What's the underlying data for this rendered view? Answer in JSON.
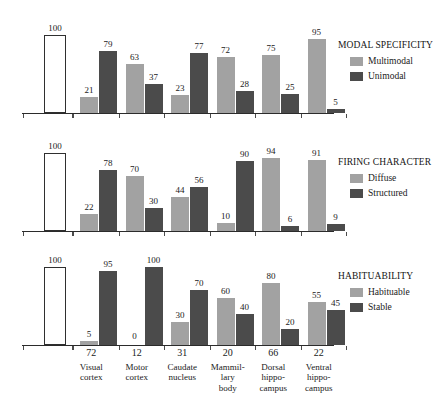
{
  "chart_data": {
    "type": "bar",
    "title": "",
    "xlabel": "",
    "ylabel": "",
    "ylim": [
      0,
      100
    ],
    "grid": false,
    "legend_position": "right",
    "categories": [
      "Visual cortex",
      "Motor cortex",
      "Caudate nucleus",
      "Mammillary body",
      "Dorsal hippocampus",
      "Ventral hippocampus"
    ],
    "category_numbers": [
      72,
      12,
      31,
      20,
      66,
      22
    ],
    "reference_bar_value": 100,
    "panels": [
      {
        "legend_title": "MODAL SPECIFICITY",
        "series": [
          {
            "name": "Multimodal",
            "color": "#a2a2a2",
            "values": [
              21,
              63,
              23,
              72,
              75,
              95
            ]
          },
          {
            "name": "Unimodal",
            "color": "#4b4b4b",
            "values": [
              79,
              37,
              77,
              28,
              25,
              5
            ]
          }
        ]
      },
      {
        "legend_title": "FIRING CHARACTER",
        "series": [
          {
            "name": "Diffuse",
            "color": "#a2a2a2",
            "values": [
              22,
              70,
              44,
              10,
              94,
              91
            ]
          },
          {
            "name": "Structured",
            "color": "#4b4b4b",
            "values": [
              78,
              30,
              56,
              90,
              6,
              9
            ]
          }
        ]
      },
      {
        "legend_title": "HABITUABILITY",
        "series": [
          {
            "name": "Habituable",
            "color": "#a2a2a2",
            "values": [
              5,
              0,
              30,
              60,
              80,
              55
            ]
          },
          {
            "name": "Stable",
            "color": "#4b4b4b",
            "values": [
              95,
              100,
              70,
              40,
              20,
              45
            ]
          }
        ]
      }
    ]
  },
  "category_labels_wrapped": [
    [
      "Visual",
      "cortex"
    ],
    [
      "Motor",
      "cortex"
    ],
    [
      "Caudate",
      "nucleus"
    ],
    [
      "Mammil-",
      "lary",
      "body"
    ],
    [
      "Dorsal",
      "hippo-",
      "campus"
    ],
    [
      "Ventral",
      "hippo-",
      "campus"
    ]
  ],
  "colors": {
    "light_series": "#a2a2a2",
    "dark_series": "#4b4b4b",
    "axis": "#2b2b2b",
    "reference_bar_fill": "#ffffff",
    "background": "#ffffff",
    "text": "#1a1a1a"
  }
}
